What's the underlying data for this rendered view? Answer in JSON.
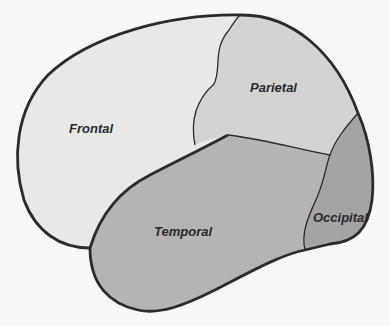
{
  "diagram": {
    "lobes": [
      {
        "id": "frontal",
        "label": "Frontal",
        "fill": "#e8e8e8"
      },
      {
        "id": "parietal",
        "label": "Parietal",
        "fill": "#d3d3d3"
      },
      {
        "id": "temporal",
        "label": "Temporal",
        "fill": "#b4b4b4"
      },
      {
        "id": "occipital",
        "label": "Occipital",
        "fill": "#a4a4a4"
      }
    ],
    "colors": {
      "background": "#f7f7f7",
      "outline": "#2b2b2b"
    }
  }
}
